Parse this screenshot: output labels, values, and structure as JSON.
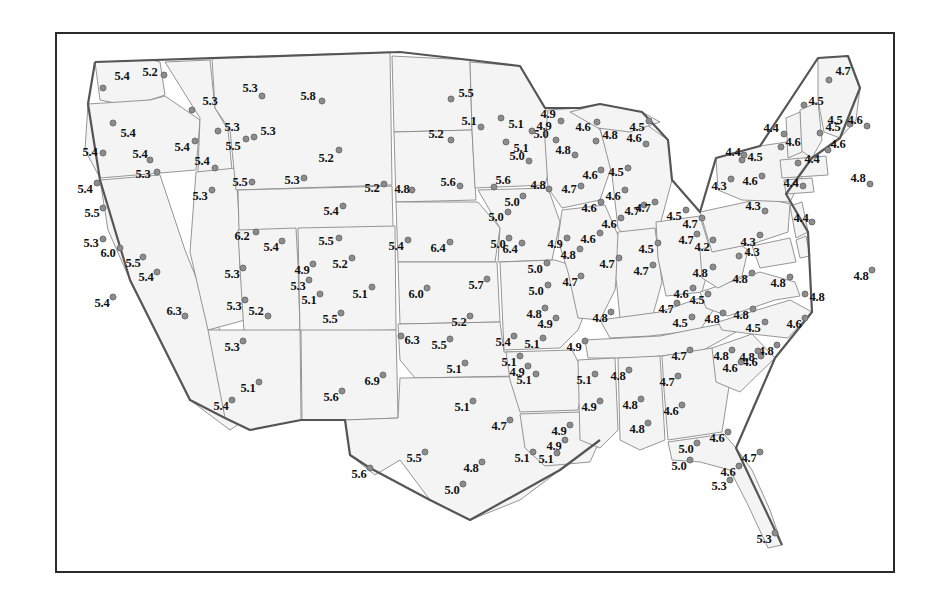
{
  "chart_data": {
    "type": "scatter",
    "title": "",
    "subtitle": "",
    "xlabel": "",
    "ylabel": "",
    "legend": [],
    "grid": false,
    "value_range": [
      4.2,
      6.9
    ],
    "point_count": 170,
    "dot_color": "#8c8c8c",
    "land_fill": "#f4f4f4",
    "state_border_color": "#8a8a8a",
    "frame_color": "#2b2b2b",
    "points": [
      {
        "label": "5.4",
        "x": 103,
        "y": 88,
        "dx": 122,
        "dy": 76
      },
      {
        "label": "5.2",
        "x": 164,
        "y": 75,
        "dx": 150,
        "dy": 72
      },
      {
        "label": "5.3",
        "x": 192,
        "y": 110,
        "dx": 210,
        "dy": 101
      },
      {
        "label": "5.3",
        "x": 262,
        "y": 96,
        "dx": 250,
        "dy": 88
      },
      {
        "label": "5.8",
        "x": 322,
        "y": 101,
        "dx": 308,
        "dy": 96
      },
      {
        "label": "5.5",
        "x": 451,
        "y": 99,
        "dx": 466,
        "dy": 93
      },
      {
        "label": "5.1",
        "x": 501,
        "y": 118,
        "dx": 516,
        "dy": 124
      },
      {
        "label": "4.9",
        "x": 561,
        "y": 121,
        "dx": 548,
        "dy": 114
      },
      {
        "label": "4.6",
        "x": 597,
        "y": 122,
        "dx": 583,
        "dy": 127
      },
      {
        "label": "4.5",
        "x": 649,
        "y": 121,
        "dx": 637,
        "dy": 127
      },
      {
        "label": "4.7",
        "x": 829,
        "y": 80,
        "dx": 843,
        "dy": 71
      },
      {
        "label": "4.5",
        "x": 850,
        "y": 124,
        "dx": 835,
        "dy": 120
      },
      {
        "label": "4.6",
        "x": 867,
        "y": 126,
        "dx": 855,
        "dy": 120
      },
      {
        "label": "5.4",
        "x": 113,
        "y": 123,
        "dx": 128,
        "dy": 133
      },
      {
        "label": "5.4",
        "x": 195,
        "y": 141,
        "dx": 182,
        "dy": 147
      },
      {
        "label": "5.3",
        "x": 218,
        "y": 131,
        "dx": 232,
        "dy": 127
      },
      {
        "label": "5.3",
        "x": 254,
        "y": 137,
        "dx": 268,
        "dy": 131
      },
      {
        "label": "5.5",
        "x": 246,
        "y": 139,
        "dx": 233,
        "dy": 146
      },
      {
        "label": "5.2",
        "x": 339,
        "y": 150,
        "dx": 326,
        "dy": 158
      },
      {
        "label": "5.2",
        "x": 451,
        "y": 140,
        "dx": 436,
        "dy": 134
      },
      {
        "label": "5.1",
        "x": 506,
        "y": 142,
        "dx": 521,
        "dy": 148
      },
      {
        "label": "4.8",
        "x": 596,
        "y": 141,
        "dx": 610,
        "dy": 135
      },
      {
        "label": "4.6",
        "x": 646,
        "y": 144,
        "dx": 634,
        "dy": 138
      },
      {
        "label": "5.0",
        "x": 556,
        "y": 140,
        "dx": 541,
        "dy": 134
      },
      {
        "label": "4.4",
        "x": 784,
        "y": 134,
        "dx": 771,
        "dy": 128
      },
      {
        "label": "4.5",
        "x": 820,
        "y": 133,
        "dx": 833,
        "dy": 127
      },
      {
        "label": "4.6",
        "x": 828,
        "y": 150,
        "dx": 838,
        "dy": 144
      },
      {
        "label": "4.8",
        "x": 870,
        "y": 184,
        "dx": 858,
        "dy": 178
      },
      {
        "label": "5.4",
        "x": 103,
        "y": 153,
        "dx": 90,
        "dy": 152
      },
      {
        "label": "5.4",
        "x": 150,
        "y": 160,
        "dx": 140,
        "dy": 154
      },
      {
        "label": "5.3",
        "x": 157,
        "y": 172,
        "dx": 143,
        "dy": 174
      },
      {
        "label": "5.4",
        "x": 215,
        "y": 168,
        "dx": 202,
        "dy": 161
      },
      {
        "label": "5.3",
        "x": 212,
        "y": 190,
        "dx": 200,
        "dy": 196
      },
      {
        "label": "5.5",
        "x": 252,
        "y": 182,
        "dx": 240,
        "dy": 182
      },
      {
        "label": "5.3",
        "x": 304,
        "y": 178,
        "dx": 292,
        "dy": 180
      },
      {
        "label": "5.2",
        "x": 384,
        "y": 184,
        "dx": 372,
        "dy": 188
      },
      {
        "label": "4.8",
        "x": 412,
        "y": 190,
        "dx": 402,
        "dy": 189
      },
      {
        "label": "5.6",
        "x": 460,
        "y": 186,
        "dx": 448,
        "dy": 182
      },
      {
        "label": "5.6",
        "x": 494,
        "y": 187,
        "dx": 503,
        "dy": 180
      },
      {
        "label": "4.8",
        "x": 549,
        "y": 189,
        "dx": 538,
        "dy": 185
      },
      {
        "label": "4.7",
        "x": 581,
        "y": 186,
        "dx": 569,
        "dy": 189
      },
      {
        "label": "4.6",
        "x": 601,
        "y": 170,
        "dx": 590,
        "dy": 175
      },
      {
        "label": "4.5",
        "x": 628,
        "y": 168,
        "dx": 616,
        "dy": 172
      },
      {
        "label": "4.6",
        "x": 762,
        "y": 176,
        "dx": 750,
        "dy": 181
      },
      {
        "label": "4.3",
        "x": 731,
        "y": 179,
        "dx": 719,
        "dy": 186
      },
      {
        "label": "4.4",
        "x": 803,
        "y": 186,
        "dx": 791,
        "dy": 183
      },
      {
        "label": "4.3",
        "x": 765,
        "y": 211,
        "dx": 753,
        "dy": 206
      },
      {
        "label": "4.4",
        "x": 744,
        "y": 155,
        "dx": 733,
        "dy": 152
      },
      {
        "label": "4.5",
        "x": 742,
        "y": 160,
        "dx": 755,
        "dy": 157
      },
      {
        "label": "5.5",
        "x": 103,
        "y": 208,
        "dx": 92,
        "dy": 213
      },
      {
        "label": "5.4",
        "x": 343,
        "y": 206,
        "dx": 331,
        "dy": 211
      },
      {
        "label": "5.0",
        "x": 508,
        "y": 212,
        "dx": 496,
        "dy": 217
      },
      {
        "label": "4.6",
        "x": 601,
        "y": 202,
        "dx": 589,
        "dy": 208
      },
      {
        "label": "4.7",
        "x": 644,
        "y": 205,
        "dx": 632,
        "dy": 211
      },
      {
        "label": "4.4",
        "x": 812,
        "y": 222,
        "dx": 801,
        "dy": 218
      },
      {
        "label": "5.3",
        "x": 103,
        "y": 239,
        "dx": 91,
        "dy": 243
      },
      {
        "label": "6.0",
        "x": 120,
        "y": 248,
        "dx": 108,
        "dy": 253
      },
      {
        "label": "5.5",
        "x": 143,
        "y": 257,
        "dx": 133,
        "dy": 263
      },
      {
        "label": "6.2",
        "x": 256,
        "y": 232,
        "dx": 242,
        "dy": 236
      },
      {
        "label": "5.4",
        "x": 282,
        "y": 241,
        "dx": 271,
        "dy": 247
      },
      {
        "label": "5.5",
        "x": 339,
        "y": 238,
        "dx": 326,
        "dy": 241
      },
      {
        "label": "5.4",
        "x": 408,
        "y": 240,
        "dx": 396,
        "dy": 246
      },
      {
        "label": "6.4",
        "x": 450,
        "y": 242,
        "dx": 438,
        "dy": 248
      },
      {
        "label": "6.4",
        "x": 522,
        "y": 243,
        "dx": 510,
        "dy": 249
      },
      {
        "label": "4.9",
        "x": 567,
        "y": 238,
        "dx": 555,
        "dy": 244
      },
      {
        "label": "4.6",
        "x": 600,
        "y": 233,
        "dx": 588,
        "dy": 239
      },
      {
        "label": "4.5",
        "x": 658,
        "y": 243,
        "dx": 646,
        "dy": 249
      },
      {
        "label": "4.2",
        "x": 713,
        "y": 240,
        "dx": 702,
        "dy": 247
      },
      {
        "label": "4.7",
        "x": 702,
        "y": 218,
        "dx": 690,
        "dy": 224
      },
      {
        "label": "4.3",
        "x": 760,
        "y": 235,
        "dx": 748,
        "dy": 242
      },
      {
        "label": "4.8",
        "x": 872,
        "y": 270,
        "dx": 861,
        "dy": 276
      },
      {
        "label": "5.4",
        "x": 157,
        "y": 272,
        "dx": 146,
        "dy": 277
      },
      {
        "label": "5.3",
        "x": 243,
        "y": 268,
        "dx": 232,
        "dy": 274
      },
      {
        "label": "4.9",
        "x": 313,
        "y": 264,
        "dx": 302,
        "dy": 270
      },
      {
        "label": "5.3",
        "x": 309,
        "y": 280,
        "dx": 298,
        "dy": 286
      },
      {
        "label": "5.2",
        "x": 352,
        "y": 258,
        "dx": 340,
        "dy": 264
      },
      {
        "label": "5.1",
        "x": 320,
        "y": 294,
        "dx": 309,
        "dy": 300
      },
      {
        "label": "5.1",
        "x": 372,
        "y": 287,
        "dx": 360,
        "dy": 294
      },
      {
        "label": "6.0",
        "x": 427,
        "y": 288,
        "dx": 416,
        "dy": 294
      },
      {
        "label": "5.7",
        "x": 487,
        "y": 279,
        "dx": 476,
        "dy": 285
      },
      {
        "label": "5.0",
        "x": 547,
        "y": 263,
        "dx": 535,
        "dy": 269
      },
      {
        "label": "5.0",
        "x": 548,
        "y": 285,
        "dx": 536,
        "dy": 291
      },
      {
        "label": "4.7",
        "x": 581,
        "y": 276,
        "dx": 570,
        "dy": 282
      },
      {
        "label": "4.7",
        "x": 653,
        "y": 265,
        "dx": 641,
        "dy": 271
      },
      {
        "label": "4.8",
        "x": 713,
        "y": 267,
        "dx": 700,
        "dy": 273
      },
      {
        "label": "4.8",
        "x": 752,
        "y": 273,
        "dx": 740,
        "dy": 279
      },
      {
        "label": "4.8",
        "x": 790,
        "y": 277,
        "dx": 778,
        "dy": 283
      },
      {
        "label": "5.3",
        "x": 245,
        "y": 300,
        "dx": 234,
        "dy": 306
      },
      {
        "label": "5.4",
        "x": 113,
        "y": 297,
        "dx": 102,
        "dy": 303
      },
      {
        "label": "6.3",
        "x": 185,
        "y": 316,
        "dx": 174,
        "dy": 311
      },
      {
        "label": "5.2",
        "x": 268,
        "y": 316,
        "dx": 256,
        "dy": 311
      },
      {
        "label": "5.5",
        "x": 341,
        "y": 313,
        "dx": 330,
        "dy": 319
      },
      {
        "label": "5.2",
        "x": 470,
        "y": 316,
        "dx": 459,
        "dy": 322
      },
      {
        "label": "4.8",
        "x": 545,
        "y": 308,
        "dx": 534,
        "dy": 314
      },
      {
        "label": "4.8",
        "x": 611,
        "y": 312,
        "dx": 600,
        "dy": 318
      },
      {
        "label": "4.7",
        "x": 677,
        "y": 303,
        "dx": 666,
        "dy": 309
      },
      {
        "label": "4.5",
        "x": 692,
        "y": 317,
        "dx": 680,
        "dy": 323
      },
      {
        "label": "4.8",
        "x": 723,
        "y": 313,
        "dx": 712,
        "dy": 319
      },
      {
        "label": "4.8",
        "x": 753,
        "y": 309,
        "dx": 741,
        "dy": 315
      },
      {
        "label": "4.5",
        "x": 765,
        "y": 322,
        "dx": 753,
        "dy": 328
      },
      {
        "label": "4.6",
        "x": 805,
        "y": 318,
        "dx": 794,
        "dy": 324
      },
      {
        "label": "4.8",
        "x": 805,
        "y": 294,
        "dx": 817,
        "dy": 297
      },
      {
        "label": "5.3",
        "x": 243,
        "y": 341,
        "dx": 232,
        "dy": 347
      },
      {
        "label": "6.3",
        "x": 401,
        "y": 336,
        "dx": 412,
        "dy": 340
      },
      {
        "label": "5.5",
        "x": 450,
        "y": 339,
        "dx": 439,
        "dy": 345
      },
      {
        "label": "5.4",
        "x": 514,
        "y": 336,
        "dx": 503,
        "dy": 342
      },
      {
        "label": "5.1",
        "x": 543,
        "y": 338,
        "dx": 532,
        "dy": 344
      },
      {
        "label": "4.9",
        "x": 585,
        "y": 341,
        "dx": 574,
        "dy": 347
      },
      {
        "label": "4.7",
        "x": 690,
        "y": 350,
        "dx": 679,
        "dy": 356
      },
      {
        "label": "4.8",
        "x": 732,
        "y": 350,
        "dx": 721,
        "dy": 356
      },
      {
        "label": "4.6",
        "x": 761,
        "y": 356,
        "dx": 750,
        "dy": 362
      },
      {
        "label": "4.8",
        "x": 777,
        "y": 345,
        "dx": 766,
        "dy": 351
      },
      {
        "label": "5.1",
        "x": 465,
        "y": 363,
        "dx": 454,
        "dy": 369
      },
      {
        "label": "5.1",
        "x": 536,
        "y": 374,
        "dx": 524,
        "dy": 380
      },
      {
        "label": "4.9",
        "x": 528,
        "y": 366,
        "dx": 517,
        "dy": 372
      },
      {
        "label": "5.1",
        "x": 595,
        "y": 374,
        "dx": 584,
        "dy": 380
      },
      {
        "label": "4.8",
        "x": 629,
        "y": 370,
        "dx": 618,
        "dy": 376
      },
      {
        "label": "4.7",
        "x": 678,
        "y": 376,
        "dx": 667,
        "dy": 382
      },
      {
        "label": "4.6",
        "x": 741,
        "y": 362,
        "dx": 730,
        "dy": 368
      },
      {
        "label": "4.8",
        "x": 758,
        "y": 351,
        "dx": 747,
        "dy": 357
      },
      {
        "label": "5.4",
        "x": 232,
        "y": 400,
        "dx": 221,
        "dy": 406
      },
      {
        "label": "5.1",
        "x": 259,
        "y": 382,
        "dx": 248,
        "dy": 388
      },
      {
        "label": "6.9",
        "x": 383,
        "y": 375,
        "dx": 372,
        "dy": 381
      },
      {
        "label": "5.6",
        "x": 342,
        "y": 391,
        "dx": 331,
        "dy": 397
      },
      {
        "label": "5.1",
        "x": 473,
        "y": 401,
        "dx": 462,
        "dy": 407
      },
      {
        "label": "4.9",
        "x": 600,
        "y": 401,
        "dx": 589,
        "dy": 407
      },
      {
        "label": "4.8",
        "x": 641,
        "y": 399,
        "dx": 630,
        "dy": 405
      },
      {
        "label": "4.6",
        "x": 682,
        "y": 405,
        "dx": 671,
        "dy": 411
      },
      {
        "label": "4.7",
        "x": 510,
        "y": 420,
        "dx": 499,
        "dy": 426
      },
      {
        "label": "4.9",
        "x": 565,
        "y": 440,
        "dx": 554,
        "dy": 446
      },
      {
        "label": "5.1",
        "x": 533,
        "y": 452,
        "dx": 522,
        "dy": 458
      },
      {
        "label": "5.0",
        "x": 697,
        "y": 443,
        "dx": 686,
        "dy": 449
      },
      {
        "label": "4.6",
        "x": 728,
        "y": 432,
        "dx": 717,
        "dy": 438
      },
      {
        "label": "4.7",
        "x": 760,
        "y": 452,
        "dx": 749,
        "dy": 458
      },
      {
        "label": "5.6",
        "x": 370,
        "y": 468,
        "dx": 359,
        "dy": 474
      },
      {
        "label": "5.5",
        "x": 425,
        "y": 452,
        "dx": 414,
        "dy": 458
      },
      {
        "label": "4.8",
        "x": 482,
        "y": 462,
        "dx": 471,
        "dy": 468
      },
      {
        "label": "5.0",
        "x": 463,
        "y": 484,
        "dx": 452,
        "dy": 490
      },
      {
        "label": "5.1",
        "x": 557,
        "y": 453,
        "dx": 546,
        "dy": 459
      },
      {
        "label": "5.3",
        "x": 730,
        "y": 480,
        "dx": 719,
        "dy": 486
      },
      {
        "label": "5.3",
        "x": 775,
        "y": 533,
        "dx": 764,
        "dy": 539
      },
      {
        "label": "5.0",
        "x": 523,
        "y": 196,
        "dx": 512,
        "dy": 202
      },
      {
        "label": "5.0",
        "x": 509,
        "y": 238,
        "dx": 498,
        "dy": 244
      },
      {
        "label": "4.6",
        "x": 625,
        "y": 190,
        "dx": 613,
        "dy": 196
      },
      {
        "label": "4.7",
        "x": 655,
        "y": 202,
        "dx": 643,
        "dy": 208
      },
      {
        "label": "4.6",
        "x": 621,
        "y": 218,
        "dx": 609,
        "dy": 224
      },
      {
        "label": "4.7",
        "x": 619,
        "y": 258,
        "dx": 607,
        "dy": 264
      },
      {
        "label": "4.5",
        "x": 686,
        "y": 210,
        "dx": 674,
        "dy": 216
      },
      {
        "label": "4.4",
        "x": 798,
        "y": 163,
        "dx": 812,
        "dy": 159
      },
      {
        "label": "4.6",
        "x": 781,
        "y": 147,
        "dx": 793,
        "dy": 142
      },
      {
        "label": "4.5",
        "x": 804,
        "y": 105,
        "dx": 816,
        "dy": 101
      },
      {
        "label": "4.8",
        "x": 575,
        "y": 155,
        "dx": 563,
        "dy": 150
      },
      {
        "label": "5.0",
        "x": 529,
        "y": 161,
        "dx": 517,
        "dy": 156
      },
      {
        "label": "4.9",
        "x": 532,
        "y": 131,
        "dx": 544,
        "dy": 126
      },
      {
        "label": "5.1",
        "x": 481,
        "y": 127,
        "dx": 469,
        "dy": 121
      },
      {
        "label": "4.8",
        "x": 580,
        "y": 249,
        "dx": 568,
        "dy": 255
      },
      {
        "label": "4.7",
        "x": 697,
        "y": 234,
        "dx": 686,
        "dy": 240
      },
      {
        "label": "4.3",
        "x": 739,
        "y": 256,
        "dx": 752,
        "dy": 252
      },
      {
        "label": "4.5",
        "x": 708,
        "y": 294,
        "dx": 697,
        "dy": 300
      },
      {
        "label": "4.6",
        "x": 693,
        "y": 288,
        "dx": 681,
        "dy": 294
      },
      {
        "label": "4.9",
        "x": 556,
        "y": 318,
        "dx": 545,
        "dy": 324
      },
      {
        "label": "5.1",
        "x": 520,
        "y": 356,
        "dx": 509,
        "dy": 362
      },
      {
        "label": "4.9",
        "x": 570,
        "y": 425,
        "dx": 559,
        "dy": 431
      },
      {
        "label": "4.8",
        "x": 648,
        "y": 423,
        "dx": 637,
        "dy": 429
      },
      {
        "label": "5.0",
        "x": 690,
        "y": 460,
        "dx": 679,
        "dy": 466
      },
      {
        "label": "4.6",
        "x": 739,
        "y": 466,
        "dx": 728,
        "dy": 472
      },
      {
        "label": "5.4",
        "x": 97,
        "y": 183,
        "dx": 85,
        "dy": 189
      }
    ]
  },
  "frame": {
    "left": 55,
    "top": 32,
    "width": 840,
    "height": 541
  }
}
